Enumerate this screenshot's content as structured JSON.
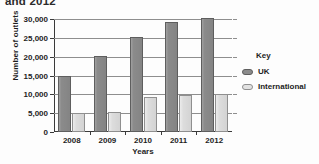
{
  "chart_data": {
    "type": "bar",
    "title": "and 2012",
    "xlabel": "Years",
    "ylabel": "Number of outlets",
    "categories": [
      "2008",
      "2009",
      "2010",
      "2011",
      "2012"
    ],
    "series": [
      {
        "name": "UK",
        "color": "#8b8b8b",
        "values": [
          15000,
          20200,
          25300,
          29200,
          30300
        ]
      },
      {
        "name": "International",
        "color": "#dcdcdc",
        "values": [
          5000,
          5300,
          9400,
          9900,
          10000
        ]
      }
    ],
    "ylim": [
      0,
      30000
    ],
    "ytick_values": [
      0,
      5000,
      10000,
      15000,
      20000,
      25000,
      30000
    ],
    "ytick_labels": [
      "0",
      "5,000",
      "10,000",
      "15,000",
      "20,000",
      "25,000",
      "30,000"
    ],
    "grid": true,
    "legend_position": "right",
    "legend_title": "Key"
  }
}
